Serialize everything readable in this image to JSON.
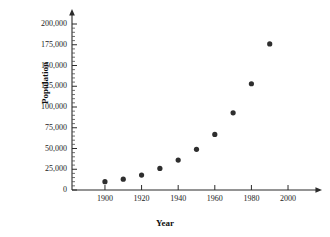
{
  "chart_data": {
    "type": "scatter",
    "title": "",
    "xlabel": "Year",
    "ylabel": "Population",
    "x": [
      1900,
      1910,
      1920,
      1930,
      1940,
      1950,
      1960,
      1970,
      1980,
      1990
    ],
    "values": [
      10000,
      13000,
      18000,
      26000,
      36000,
      49000,
      67000,
      93000,
      128000,
      176000
    ],
    "series": [
      {
        "name": "Population",
        "points": [
          {
            "x": 1900,
            "y": 10000
          },
          {
            "x": 1910,
            "y": 13000
          },
          {
            "x": 1920,
            "y": 18000
          },
          {
            "x": 1930,
            "y": 26000
          },
          {
            "x": 1940,
            "y": 36000
          },
          {
            "x": 1950,
            "y": 49000
          },
          {
            "x": 1960,
            "y": 67000
          },
          {
            "x": 1970,
            "y": 93000
          },
          {
            "x": 1980,
            "y": 128000
          },
          {
            "x": 1990,
            "y": 176000
          }
        ]
      }
    ],
    "xlim": [
      1882,
      2012
    ],
    "ylim": [
      0,
      208000
    ],
    "x_ticks": [
      1900,
      1920,
      1940,
      1960,
      1980,
      2000
    ],
    "x_tick_labels": [
      "1900",
      "1920",
      "1940",
      "1960",
      "1980",
      "2000"
    ],
    "x_minor_step": 10,
    "y_ticks": [
      0,
      25000,
      50000,
      75000,
      100000,
      125000,
      150000,
      175000,
      200000
    ],
    "y_tick_labels": [
      "0",
      "25,000",
      "50,000",
      "75,000",
      "100,000",
      "125,000",
      "150,000",
      "175,000",
      "200,000"
    ],
    "y_minor_step": 5000,
    "grid": false,
    "legend": false,
    "marker": "filled-circle",
    "marker_color": "#2e2e2e",
    "axis_color": "#2b2b2b",
    "background": "#ffffff",
    "arrow_heads": [
      "x-axis-right",
      "y-axis-top"
    ]
  },
  "axes": {
    "y_title": "Population",
    "x_title": "Year"
  }
}
